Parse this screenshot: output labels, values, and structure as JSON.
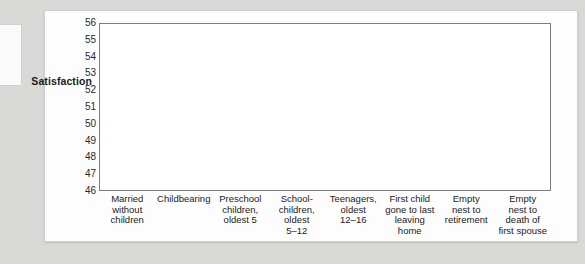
{
  "figure": {
    "axis_title": "Satisfaction"
  },
  "chart_data": {
    "type": "line",
    "title": "",
    "xlabel": "",
    "ylabel": "Satisfaction",
    "ylim": [
      46,
      56
    ],
    "yticks": [
      46,
      47,
      48,
      49,
      50,
      51,
      52,
      53,
      54,
      55,
      56
    ],
    "grid": true,
    "legend": "none",
    "categories": [
      "Married without children",
      "Childbearing",
      "Preschool children, oldest 5",
      "School-children, oldest 5–12",
      "Teenagers, oldest 12–16",
      "First child gone to last leaving home",
      "Empty nest to retirement",
      "Empty nest to death of first spouse"
    ],
    "category_lines": [
      [
        "Married",
        "without",
        "children"
      ],
      [
        "Childbearing"
      ],
      [
        "Preschool",
        "children,",
        "oldest 5"
      ],
      [
        "School-",
        "children,",
        "oldest",
        "5–12"
      ],
      [
        "Teenagers,",
        "oldest",
        "12–16"
      ],
      [
        "First child",
        "gone to last",
        "leaving",
        "home"
      ],
      [
        "Empty",
        "nest to",
        "retirement"
      ],
      [
        "Empty",
        "nest to",
        "death of",
        "first spouse"
      ]
    ],
    "series": [
      {
        "name": "Series A",
        "color": "#8e8e8e",
        "values": [
          56.0,
          52.1,
          50.2,
          49.0,
          48.8,
          49.6,
          54.0,
          54.2
        ]
      },
      {
        "name": "Series B",
        "color": "#9a9a9a",
        "values": [
          52.9,
          51.4,
          51.0,
          51.1,
          48.0,
          48.6,
          52.1,
          55.8
        ]
      },
      {
        "name": "Series C",
        "color": "#999999",
        "values": [
          52.6,
          48.2,
          48.2,
          49.6,
          47.8,
          48.6,
          49.9,
          49.2
        ]
      },
      {
        "name": "Series D",
        "color": "#cccccc",
        "values": [
          53.2,
          50.6,
          47.6,
          49.2,
          48.2,
          48.4,
          48.7,
          null
        ]
      }
    ]
  }
}
